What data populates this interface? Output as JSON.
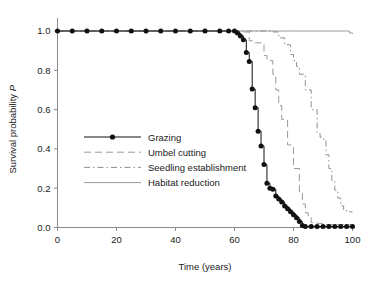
{
  "chart_data": {
    "type": "line",
    "title": "",
    "xlabel": "Time (years)",
    "ylabel": "Survival probability P",
    "ylabel_plain": "Survival probability",
    "ylabel_italic": "P",
    "xlim": [
      0,
      100
    ],
    "ylim": [
      0.0,
      1.0
    ],
    "xticks": [
      0,
      20,
      40,
      60,
      80,
      100
    ],
    "xtick_labels": [
      "0",
      "20",
      "40",
      "60",
      "80",
      "100"
    ],
    "yticks": [
      0.0,
      0.2,
      0.4,
      0.6,
      0.8,
      1.0
    ],
    "ytick_labels": [
      "0.0",
      "0.2",
      "0.4",
      "0.6",
      "0.8",
      "1.0"
    ],
    "grid": false,
    "legend_position": "center-left",
    "colors": {
      "grazing": "#111111",
      "umbel_cutting": "#9a9a9a",
      "seedling_establishment": "#8f8f8f",
      "habitat_reduction": "#9a9a9a",
      "axis": "#8a8a8a",
      "text": "#1a1a1a"
    },
    "series": [
      {
        "name": "Grazing",
        "style": "solid-with-markers",
        "marker": "filled-circle",
        "x": [
          0,
          5,
          10,
          15,
          20,
          25,
          30,
          35,
          40,
          45,
          50,
          55,
          58,
          60,
          61,
          62,
          63,
          64,
          65,
          66,
          67,
          68,
          69,
          70,
          71,
          72,
          73,
          74,
          75,
          76,
          77,
          78,
          79,
          80,
          81,
          82,
          83,
          84,
          86,
          88,
          90,
          92,
          94,
          96,
          98,
          100
        ],
        "y": [
          1.0,
          1.0,
          1.0,
          1.0,
          1.0,
          1.0,
          1.0,
          1.0,
          1.0,
          1.0,
          1.0,
          1.0,
          1.0,
          1.0,
          0.99,
          0.975,
          0.955,
          0.89,
          0.845,
          0.705,
          0.61,
          0.49,
          0.415,
          0.32,
          0.225,
          0.2,
          0.195,
          0.16,
          0.145,
          0.13,
          0.11,
          0.095,
          0.08,
          0.065,
          0.05,
          0.03,
          0.01,
          0.005,
          0.005,
          0.005,
          0.005,
          0.005,
          0.005,
          0.005,
          0.005,
          0.005
        ]
      },
      {
        "name": "Umbel cutting",
        "style": "long-dash",
        "marker": "none",
        "x": [
          0,
          20,
          40,
          55,
          60,
          63,
          65,
          67,
          69,
          70,
          71,
          72,
          73,
          74,
          75,
          76,
          78,
          80,
          82,
          83,
          84,
          85,
          86,
          88,
          90,
          95,
          100
        ],
        "y": [
          1.0,
          1.0,
          1.0,
          1.0,
          1.0,
          0.995,
          0.95,
          0.94,
          0.935,
          0.875,
          0.855,
          0.85,
          0.78,
          0.7,
          0.62,
          0.55,
          0.42,
          0.3,
          0.18,
          0.12,
          0.075,
          0.05,
          0.025,
          0.02,
          0.015,
          0.015,
          0.015
        ]
      },
      {
        "name": "Seedling establishment",
        "style": "dash-dot",
        "marker": "none",
        "x": [
          0,
          20,
          40,
          60,
          70,
          73,
          75,
          77,
          79,
          80,
          81,
          82,
          84,
          86,
          88,
          89,
          90,
          91,
          92,
          93,
          94,
          95,
          96,
          97,
          98,
          100
        ],
        "y": [
          1.0,
          1.0,
          1.0,
          1.0,
          1.0,
          0.995,
          0.965,
          0.93,
          0.88,
          0.85,
          0.82,
          0.78,
          0.7,
          0.6,
          0.48,
          0.46,
          0.45,
          0.37,
          0.3,
          0.24,
          0.19,
          0.15,
          0.11,
          0.09,
          0.08,
          0.08
        ]
      },
      {
        "name": "Habitat reduction",
        "style": "solid",
        "marker": "none",
        "x": [
          0,
          20,
          40,
          60,
          80,
          90,
          96,
          98,
          99,
          100
        ],
        "y": [
          1.0,
          1.0,
          1.0,
          1.0,
          1.0,
          1.0,
          1.0,
          1.0,
          0.99,
          0.985
        ]
      }
    ],
    "legend_entries": [
      {
        "label": "Grazing",
        "style": "solid-with-markers"
      },
      {
        "label": "Umbel cutting",
        "style": "long-dash"
      },
      {
        "label": "Seedling establishment",
        "style": "dash-dot"
      },
      {
        "label": "Habitat reduction",
        "style": "solid"
      }
    ]
  }
}
